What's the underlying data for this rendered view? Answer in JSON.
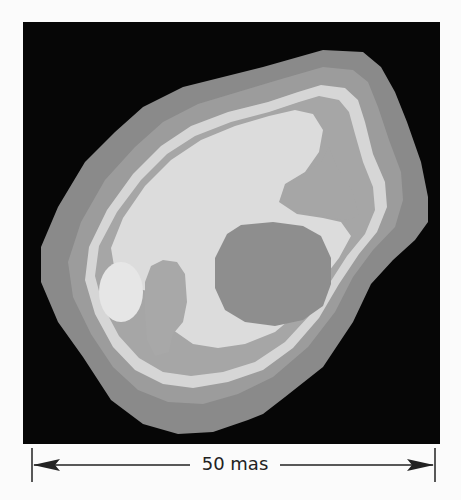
{
  "image": {
    "description": "Grayscale contour image of an extended stellar/radio source with nested brightness levels and a dark central cavity",
    "colors": {
      "background": "#060606",
      "outer_halo": "#8a8a8a",
      "ring_dark": "#9e9e9e",
      "ring_bright": "#d6d6d6",
      "inner_mid": "#a8a8a8",
      "core_bright": "#dcdcdc",
      "cavity": "#8e8e8e",
      "blob_light": "#e6e6e6"
    }
  },
  "scale_bar": {
    "label": "50 mas",
    "color": "#222222"
  }
}
